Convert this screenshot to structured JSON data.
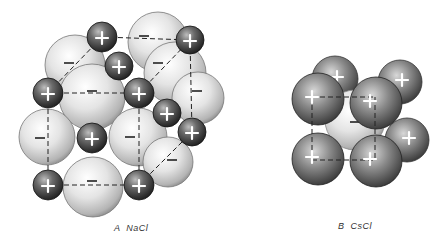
{
  "figures": [
    {
      "id": "A",
      "letter": "A",
      "compound": "NaCl",
      "caption": "A  NaCl",
      "cation_symbol": "+",
      "anion_symbol": "−",
      "anions": [
        {
          "cx": 158,
          "cy": 42,
          "r": 30
        },
        {
          "cx": 75,
          "cy": 65,
          "r": 30
        },
        {
          "cx": 175,
          "cy": 73,
          "r": 31
        },
        {
          "cx": 198,
          "cy": 98,
          "r": 26
        },
        {
          "cx": 92,
          "cy": 97,
          "r": 33
        },
        {
          "cx": 47,
          "cy": 137,
          "r": 28
        },
        {
          "cx": 138,
          "cy": 137,
          "r": 29
        },
        {
          "cx": 168,
          "cy": 162,
          "r": 25
        },
        {
          "cx": 93,
          "cy": 187,
          "r": 30
        }
      ],
      "anion_labels": [
        {
          "x": 144,
          "y": 36
        },
        {
          "x": 69,
          "y": 63
        },
        {
          "x": 158,
          "y": 63
        },
        {
          "x": 197,
          "y": 91
        },
        {
          "x": 92,
          "y": 91
        },
        {
          "x": 40,
          "y": 138
        },
        {
          "x": 130,
          "y": 137
        },
        {
          "x": 172,
          "y": 160
        },
        {
          "x": 92,
          "y": 181
        }
      ],
      "cations": [
        {
          "cx": 102,
          "cy": 37,
          "r": 15
        },
        {
          "cx": 190,
          "cy": 40,
          "r": 14
        },
        {
          "cx": 119,
          "cy": 66,
          "r": 14
        },
        {
          "cx": 48,
          "cy": 93,
          "r": 15
        },
        {
          "cx": 139,
          "cy": 93,
          "r": 15
        },
        {
          "cx": 167,
          "cy": 113,
          "r": 14
        },
        {
          "cx": 92,
          "cy": 138,
          "r": 15
        },
        {
          "cx": 192,
          "cy": 132,
          "r": 14
        },
        {
          "cx": 48,
          "cy": 185,
          "r": 15
        },
        {
          "cx": 139,
          "cy": 185,
          "r": 15
        }
      ],
      "edges": [
        [
          48,
          93,
          139,
          93
        ],
        [
          48,
          93,
          48,
          185
        ],
        [
          48,
          185,
          139,
          185
        ],
        [
          139,
          93,
          139,
          185
        ],
        [
          102,
          37,
          190,
          40
        ],
        [
          48,
          93,
          102,
          37
        ],
        [
          139,
          93,
          190,
          40
        ],
        [
          190,
          40,
          192,
          132
        ],
        [
          139,
          185,
          192,
          132
        ]
      ]
    },
    {
      "id": "B",
      "letter": "B",
      "compound": "CsCl",
      "caption": "B  CsCl",
      "cation_symbol": "+",
      "anion_symbol": "−",
      "anions": [
        {
          "cx": 355,
          "cy": 120,
          "r": 30
        }
      ],
      "anion_labels": [
        {
          "x": 355,
          "y": 122
        }
      ],
      "cations": [
        {
          "cx": 335,
          "cy": 79,
          "r": 23
        },
        {
          "cx": 400,
          "cy": 82,
          "r": 22
        },
        {
          "cx": 407,
          "cy": 140,
          "r": 22
        },
        {
          "cx": 318,
          "cy": 99,
          "r": 26
        },
        {
          "cx": 376,
          "cy": 103,
          "r": 26
        },
        {
          "cx": 318,
          "cy": 159,
          "r": 26
        },
        {
          "cx": 376,
          "cy": 161,
          "r": 26
        }
      ],
      "edges": [
        [
          312,
          97,
          375,
          97
        ],
        [
          312,
          97,
          312,
          160
        ],
        [
          312,
          160,
          375,
          160
        ],
        [
          375,
          97,
          375,
          160
        ]
      ]
    }
  ]
}
